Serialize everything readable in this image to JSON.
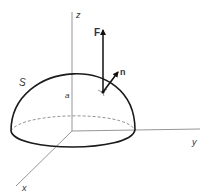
{
  "diagram": {
    "type": "hemisphere-surface-flux",
    "labels": {
      "z_axis": "z",
      "y_axis": "y",
      "x_axis": "x",
      "surface": "S",
      "radius": "a",
      "vector_field": "F",
      "normal": "n"
    },
    "colors": {
      "surface_outline": "#1a1a1a",
      "axes": "#8a8a8a",
      "vectors": "#111111",
      "background": "#ffffff"
    }
  }
}
